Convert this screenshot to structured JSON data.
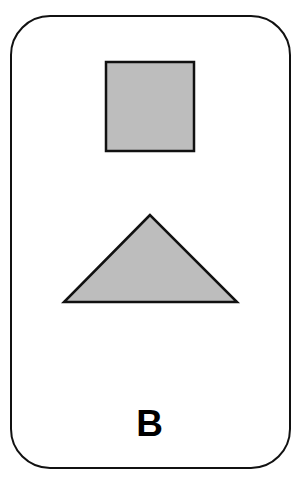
{
  "card": {
    "label": "B",
    "shapes": [
      {
        "type": "square",
        "fill": "#bdbdbd",
        "stroke": "#111111"
      },
      {
        "type": "triangle",
        "fill": "#bdbdbd",
        "stroke": "#111111"
      }
    ]
  }
}
